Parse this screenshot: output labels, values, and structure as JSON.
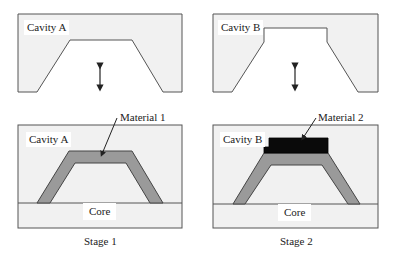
{
  "colors": {
    "mold_fill": "#f1f1f1",
    "outline": "#555555",
    "material1": "#9a9a9a",
    "material2": "#0a0a0a",
    "background": "#ffffff"
  },
  "stages": [
    {
      "label": "Stage 1",
      "open_mold": {
        "cavity_label": "Cavity A",
        "motion_icon": "double-arrow-vertical"
      },
      "closed_mold": {
        "cavity_label": "Cavity A",
        "core_label": "Core",
        "material_label": "Material 1"
      }
    },
    {
      "label": "Stage 2",
      "open_mold": {
        "cavity_label": "Cavity B",
        "motion_icon": "double-arrow-vertical"
      },
      "closed_mold": {
        "cavity_label": "Cavity B",
        "core_label": "Core",
        "material_label": "Material 2"
      }
    }
  ]
}
